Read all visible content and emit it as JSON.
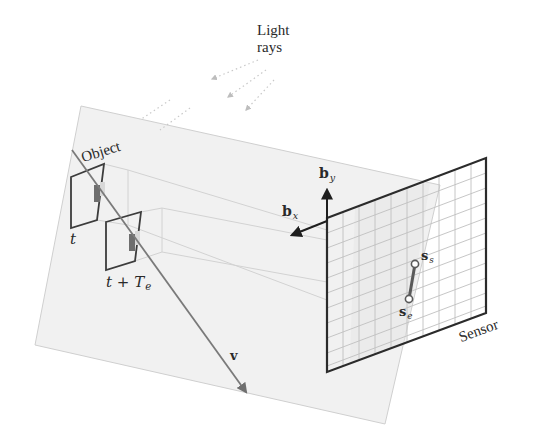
{
  "diagram": {
    "labels": {
      "light_rays": "Light",
      "light_rays_line2": "rays",
      "object": "Object",
      "time_start": "t",
      "time_end_base": "t + T",
      "time_end_sub": "e",
      "basis_x_base": "b",
      "basis_x_sub": "x",
      "basis_y_base": "b",
      "basis_y_sub": "y",
      "sensor": "Sensor",
      "start_point_base": "s",
      "start_point_sub": "s",
      "end_point_base": "s",
      "end_point_sub": "e",
      "velocity": "v"
    },
    "colors": {
      "plane_fill": "#f1f1f1",
      "plane_edge": "#c8c8c8",
      "sensor_frame": "#2b2b2b",
      "sensor_grid": "#bdbdbd",
      "object_frame": "#3c3c3c",
      "object_patch": "#6e6e6e",
      "velocity": "#7a7a7a",
      "basis_arrow": "#1e1e1e",
      "light_ray": "#c4c4c4"
    },
    "geometry": {
      "plane": [
        [
          81,
          106
        ],
        [
          440,
          185
        ],
        [
          385,
          424
        ],
        [
          35,
          345
        ]
      ],
      "sensor": [
        [
          327,
          218
        ],
        [
          486,
          158
        ],
        [
          486,
          313
        ],
        [
          327,
          372
        ]
      ],
      "basis_origin": [
        327,
        221
      ],
      "basis_x_tip": [
        290,
        236
      ],
      "basis_y_tip": [
        327,
        188
      ],
      "velocity_start": [
        72,
        150
      ],
      "velocity_end": [
        246,
        393
      ],
      "s_s": [
        415,
        264
      ],
      "s_e": [
        409,
        299
      ],
      "object_t": [
        [
          71,
          177
        ],
        [
          104,
          164
        ],
        [
          97,
          220
        ],
        [
          71,
          228
        ]
      ],
      "object_t_plus_Te": [
        [
          106,
          222
        ],
        [
          141,
          212
        ],
        [
          135,
          261
        ],
        [
          106,
          270
        ]
      ]
    }
  }
}
